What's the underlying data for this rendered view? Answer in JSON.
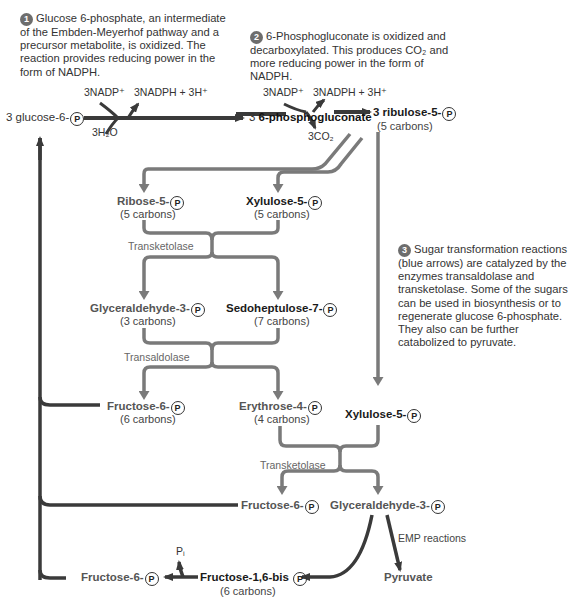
{
  "notes": {
    "step1": {
      "number": "1",
      "text": "Glucose 6-phosphate, an intermediate of the Embden-Meyerhof pathway and a precursor metabolite, is oxidized. The reaction provides reducing power in the form of NADPH."
    },
    "step2": {
      "number": "2",
      "text": "6-Phosphogluconate is oxidized and decarboxylated. This produces CO₂ and more reducing power in the form of NADPH."
    },
    "step3": {
      "number": "3",
      "text": "Sugar transformation reactions (blue arrows) are catalyzed by the enzymes transaldolase and transketolase. Some of the sugars can be used in biosynthesis or to regenerate glucose 6-phosphate. They also can be further catabolized to pyruvate."
    }
  },
  "reaction1": {
    "substrate": "3 glucose-6-",
    "input_cofactor": "3NADP⁺",
    "output_cofactor": "3NADPH + 3H⁺",
    "water": "3H₂O",
    "product_prefix": "3 ",
    "product": "6-phosphogluconate"
  },
  "reaction2": {
    "input_cofactor": "3NADP⁺",
    "output_cofactor": "3NADPH + 3H⁺",
    "released": "3CO₂",
    "product": "3 ribulose-5-",
    "product_carbons": "(5 carbons)"
  },
  "phosphate_symbol": "P",
  "metabolites": {
    "ribose5p": {
      "name": "Ribose-5-",
      "carbons": "(5 carbons)"
    },
    "xylulose5p_a": {
      "name": "Xylulose-5-",
      "carbons": "(5 carbons)"
    },
    "glyceraldehyde3p_a": {
      "name": "Glyceraldehyde-3-",
      "carbons": "(3 carbons)"
    },
    "sedoheptulose7p": {
      "name": "Sedoheptulose-7-",
      "carbons": "(7 carbons)"
    },
    "fructose6p_a": {
      "name": "Fructose-6-",
      "carbons": "(6 carbons)"
    },
    "erythrose4p": {
      "name": "Erythrose-4-",
      "carbons": "(4 carbons)"
    },
    "xylulose5p_b": {
      "name": "Xylulose-5-"
    },
    "fructose6p_b": {
      "name": "Fructose-6-"
    },
    "glyceraldehyde3p_b": {
      "name": "Glyceraldehyde-3-"
    },
    "fructose16bisp": {
      "name": "Fructose-1,6-bis",
      "carbons": "(6 carbons)"
    },
    "fructose6p_c": {
      "name": "Fructose-6-"
    },
    "pyruvate": {
      "name": "Pyruvate"
    }
  },
  "enzymes": {
    "transketolase_1": "Transketolase",
    "transaldolase": "Transaldolase",
    "transketolase_2": "Transketolase",
    "emp": "EMP reactions",
    "pi": "Pᵢ"
  },
  "colors": {
    "black_arrow": "#3a3a3a",
    "grey_arrow": "#7a7a7a",
    "number_badge": "#6d6d6d"
  }
}
